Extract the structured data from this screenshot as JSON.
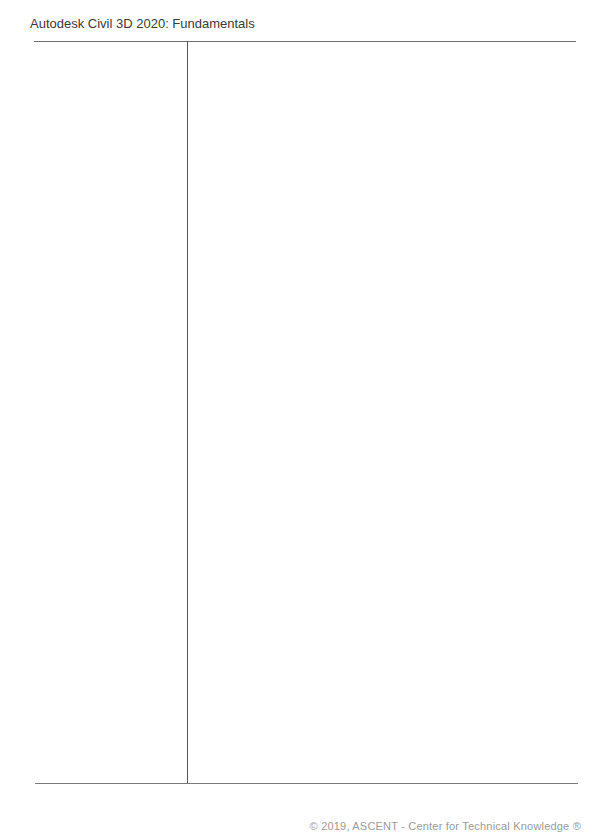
{
  "header": {
    "title": "Autodesk Civil 3D 2020: Fundamentals"
  },
  "footer": {
    "text": "© 2019, ASCENT - Center for Technical Knowledge ®"
  }
}
